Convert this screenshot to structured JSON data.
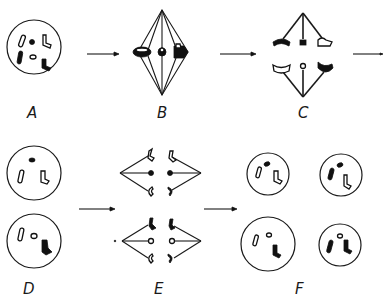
{
  "diagram": {
    "type": "meiosis-stages",
    "stages": [
      {
        "id": "A",
        "label": "A",
        "description": "cell nucleus with chromosomes"
      },
      {
        "id": "B",
        "label": "B",
        "description": "metaphase I spindle with paired chromosomes"
      },
      {
        "id": "C",
        "label": "C",
        "description": "anaphase I separation"
      },
      {
        "id": "D",
        "label": "D",
        "description": "two daughter cells"
      },
      {
        "id": "E",
        "label": "E",
        "description": "second division spindles"
      },
      {
        "id": "F",
        "label": "F",
        "description": "four resulting cells"
      }
    ],
    "arrows": [
      {
        "from": "A",
        "to": "B"
      },
      {
        "from": "B",
        "to": "C"
      },
      {
        "from": "C",
        "to": "next"
      },
      {
        "from": "D",
        "to": "E"
      },
      {
        "from": "E",
        "to": "F"
      }
    ],
    "colors": {
      "ink": "#1a1a1a",
      "background": "#ffffff"
    }
  }
}
